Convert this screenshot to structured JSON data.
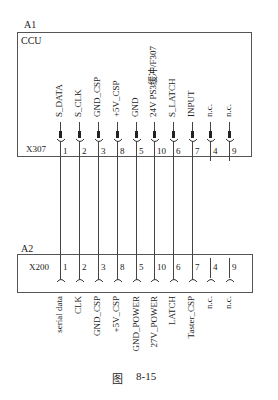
{
  "figure": {
    "caption_prefix": "图",
    "caption_number": "8-15"
  },
  "unit_a1": {
    "id": "A1",
    "name": "CCU",
    "connector": "X307",
    "signals": [
      "S_DATA",
      "S_CLK",
      "GND_CSP",
      "+5V_CSP",
      "GND",
      "24V PS3缓冲/F307",
      "S_LATCH",
      "INPUT",
      "n.c.",
      "n.c."
    ],
    "pins": [
      "1",
      "2",
      "3",
      "8",
      "5",
      "10",
      "6",
      "7",
      "4",
      "9"
    ]
  },
  "unit_a2": {
    "id": "A2",
    "connector": "X200",
    "pins": [
      "1",
      "2",
      "3",
      "8",
      "5",
      "10",
      "6",
      "7",
      "4",
      "9"
    ],
    "signals": [
      "serial data",
      "CLK",
      "GND_CSP",
      "+5V_CSP",
      "GND_POWER",
      "27V_POWER",
      "LATCH",
      "Taster_CSP",
      "n.c.",
      "n.c."
    ]
  },
  "pin_x": [
    60,
    79,
    98,
    117,
    136,
    154,
    173,
    192,
    210,
    229
  ]
}
